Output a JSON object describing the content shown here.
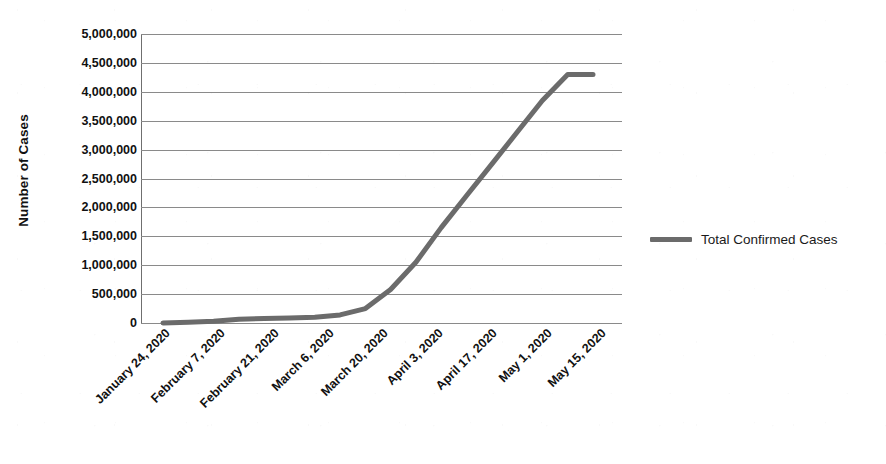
{
  "chart_data": {
    "type": "line",
    "title": "",
    "subtitle": "",
    "xlabel": "",
    "ylabel": "Number of Cases",
    "ylim": [
      0,
      5000000
    ],
    "ytick_labels": [
      "5,000,000",
      "4,500,000",
      "4,000,000",
      "3,500,000",
      "3,000,000",
      "2,500,000",
      "2,000,000",
      "1,500,000",
      "1,000,000",
      "500,000",
      "0"
    ],
    "ytick_values": [
      5000000,
      4500000,
      4000000,
      3500000,
      3000000,
      2500000,
      2000000,
      1500000,
      1000000,
      500000,
      0
    ],
    "xtick_labels": [
      "January 24, 2020",
      "February 7, 2020",
      "February 21, 2020",
      "March 6, 2020",
      "March 20, 2020",
      "April 3, 2020",
      "April 17, 2020",
      "May 1, 2020",
      "May 15, 2020"
    ],
    "grid": "horizontal",
    "legend_position": "right",
    "series": [
      {
        "name": "Total Confirmed Cases",
        "color": "#6b6b6b",
        "line_width": 5,
        "x": [
          "January 24, 2020",
          "January 31, 2020",
          "February 7, 2020",
          "February 14, 2020",
          "February 21, 2020",
          "February 28, 2020",
          "March 6, 2020",
          "March 13, 2020",
          "March 20, 2020",
          "March 27, 2020",
          "April 3, 2020",
          "April 10, 2020",
          "April 17, 2020",
          "April 24, 2020",
          "May 1, 2020",
          "May 8, 2020",
          "May 15, 2020",
          "May 22, 2020"
        ],
        "values": [
          1000,
          12000,
          32000,
          65000,
          78000,
          85000,
          100000,
          140000,
          250000,
          580000,
          1050000,
          1650000,
          2200000,
          2750000,
          3300000,
          3850000,
          4300000,
          4300000
        ]
      }
    ]
  },
  "legend": {
    "entries": [
      {
        "label": "Total Confirmed Cases",
        "color": "#6b6b6b"
      }
    ]
  },
  "colors": {
    "series_gray": "#6b6b6b",
    "gridline": "#8a8a8a",
    "axis": "#6f6f6f",
    "text": "#111111",
    "background": "#ffffff"
  }
}
